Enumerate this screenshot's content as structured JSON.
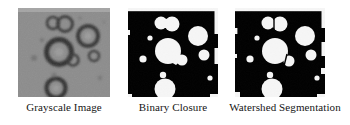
{
  "figure": {
    "background": "#ffffff",
    "panel_count": 3
  },
  "panels": [
    {
      "id": "grayscale",
      "caption": "Grayscale Image",
      "type": "grayscale-micrograph",
      "background": "#8c8c8c",
      "feature_color": "#3a3a3a",
      "description": "Gray micrograph with dark ring-shaped droplets",
      "blobs": [
        {
          "cx": 35,
          "cy": 15,
          "r": 6.0,
          "style": "ring"
        },
        {
          "cx": 47,
          "cy": 16,
          "r": 7.5,
          "style": "ring"
        },
        {
          "cx": 24,
          "cy": 32,
          "r": 2.2,
          "style": "dot"
        },
        {
          "cx": 41,
          "cy": 44,
          "r": 12.5,
          "style": "ring"
        },
        {
          "cx": 70,
          "cy": 28,
          "r": 10.0,
          "style": "ring"
        },
        {
          "cx": 76,
          "cy": 48,
          "r": 5.0,
          "style": "ring"
        },
        {
          "cx": 55,
          "cy": 52,
          "r": 5.5,
          "style": "ring"
        },
        {
          "cx": 16,
          "cy": 50,
          "r": 3.0,
          "style": "dot"
        },
        {
          "cx": 36,
          "cy": 67,
          "r": 2.6,
          "style": "dot"
        },
        {
          "cx": 38,
          "cy": 80,
          "r": 9.5,
          "style": "ring"
        },
        {
          "cx": 82,
          "cy": 70,
          "r": 2.4,
          "style": "dot"
        },
        {
          "cx": 62,
          "cy": 10,
          "r": 2.0,
          "style": "dot"
        }
      ]
    },
    {
      "id": "binary",
      "caption": "Binary Closure",
      "type": "binary-mask",
      "background": "#000000",
      "feature_color": "#f6f6f6",
      "description": "Black and white binary mask after morphological closure; touching droplets merged",
      "blobs": [
        {
          "cx": 33,
          "cy": 15,
          "r": 6.5
        },
        {
          "cx": 44,
          "cy": 16,
          "r": 7.5
        },
        {
          "cx": 22,
          "cy": 30,
          "r": 2.6
        },
        {
          "cx": 40,
          "cy": 43,
          "r": 13.0
        },
        {
          "cx": 70,
          "cy": 28,
          "r": 10.0
        },
        {
          "cx": 76,
          "cy": 47,
          "r": 5.5
        },
        {
          "cx": 54,
          "cy": 52,
          "r": 5.5
        },
        {
          "cx": 15,
          "cy": 51,
          "r": 3.6
        },
        {
          "cx": 35,
          "cy": 67,
          "r": 3.2
        },
        {
          "cx": 37,
          "cy": 81,
          "r": 10.5
        },
        {
          "cx": 82,
          "cy": 70,
          "r": 2.6
        }
      ],
      "merged_pairs": [
        [
          0,
          1
        ],
        [
          3,
          6
        ]
      ]
    },
    {
      "id": "watershed",
      "caption": "Watershed Segmentation",
      "type": "binary-mask",
      "background": "#000000",
      "feature_color": "#f6f6f6",
      "description": "Watershed-segmented mask; merged droplets split by thin dark ridge lines",
      "blobs": [
        {
          "cx": 33,
          "cy": 15,
          "r": 6.5
        },
        {
          "cx": 45,
          "cy": 16,
          "r": 7.5
        },
        {
          "cx": 22,
          "cy": 30,
          "r": 2.6
        },
        {
          "cx": 40,
          "cy": 43,
          "r": 13.0
        },
        {
          "cx": 70,
          "cy": 28,
          "r": 10.0
        },
        {
          "cx": 76,
          "cy": 47,
          "r": 5.5
        },
        {
          "cx": 54,
          "cy": 53,
          "r": 5.5
        },
        {
          "cx": 15,
          "cy": 51,
          "r": 3.6
        },
        {
          "cx": 35,
          "cy": 67,
          "r": 3.2
        },
        {
          "cx": 37,
          "cy": 81,
          "r": 10.5
        },
        {
          "cx": 82,
          "cy": 70,
          "r": 2.6
        }
      ],
      "watershed_lines": [
        {
          "x1": 39,
          "y1": 9,
          "x2": 39,
          "y2": 22
        },
        {
          "x1": 48,
          "y1": 52,
          "x2": 52,
          "y2": 46
        }
      ]
    }
  ],
  "colors": {
    "page_background": "#ffffff",
    "binary_foreground": "#f6f6f6",
    "binary_background": "#000000",
    "grayscale_background": "#8c8c8c",
    "caption_text": "#151515"
  }
}
